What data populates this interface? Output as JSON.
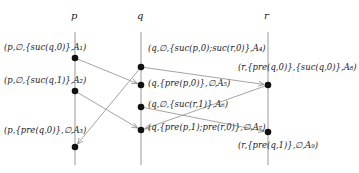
{
  "processes": [
    {
      "id": "p",
      "label": "p",
      "x": 75,
      "label_y": 10
    },
    {
      "id": "q",
      "label": "q",
      "x": 141,
      "label_y": 10
    },
    {
      "id": "r",
      "label": "r",
      "x": 268,
      "label_y": 10
    }
  ],
  "events": [
    {
      "id": "A1",
      "process": "p",
      "x": 75,
      "y": 58,
      "label": "(p,∅,{suc(q,0)},A₁)",
      "label_x": 4,
      "label_y": 42
    },
    {
      "id": "A2",
      "process": "p",
      "x": 75,
      "y": 91,
      "label": "(p,∅,{suc(q,1)},A₂)",
      "label_x": 4,
      "label_y": 75
    },
    {
      "id": "A3",
      "process": "p",
      "x": 75,
      "y": 147,
      "label": "(p,{pre(q,0)},∅,A₃)",
      "label_x": 4,
      "label_y": 125
    },
    {
      "id": "A4",
      "process": "q",
      "x": 141,
      "y": 67,
      "label": "(q,∅,{suc(p,0);suc(r,0)},A₄)",
      "label_x": 148,
      "label_y": 43
    },
    {
      "id": "A5",
      "process": "q",
      "x": 141,
      "y": 85,
      "label": "(q,{pre(p,0)},∅,A₅)",
      "label_x": 148,
      "label_y": 78
    },
    {
      "id": "A6",
      "process": "q",
      "x": 141,
      "y": 107,
      "label": "(q,∅,{suc(r,1)},A₆)",
      "label_x": 148,
      "label_y": 99
    },
    {
      "id": "A7",
      "process": "q",
      "x": 141,
      "y": 130,
      "label": "(q,{pre(p,1);pre(r,0)},∅,A₇)",
      "label_x": 148,
      "label_y": 122
    },
    {
      "id": "A8",
      "process": "r",
      "x": 268,
      "y": 85,
      "label": "(r,{pre(q,0)},{suc(q,0)},A₈)",
      "label_x": 238,
      "label_y": 62
    },
    {
      "id": "A9",
      "process": "r",
      "x": 268,
      "y": 132,
      "label": "(r,{pre(q,1)},∅,A₉)",
      "label_x": 238,
      "label_y": 140
    }
  ],
  "messages": [
    {
      "from": "A1",
      "to": "A5"
    },
    {
      "from": "A2",
      "to": "A7"
    },
    {
      "from": "A4",
      "to": "A3"
    },
    {
      "from": "A4",
      "to": "A8"
    },
    {
      "from": "A6",
      "to": "A9"
    },
    {
      "from": "A8",
      "to": "A7"
    }
  ],
  "colors": {
    "line": "#9a9a9a",
    "dot": "#111111",
    "text": "#222222"
  }
}
